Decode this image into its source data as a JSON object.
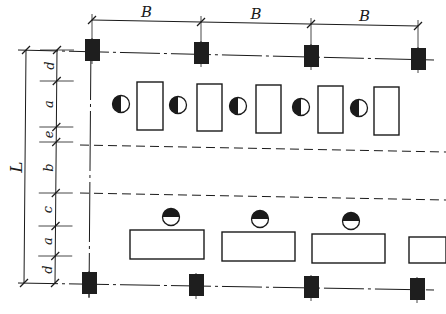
{
  "diagram": {
    "type": "workshop-layout-plan",
    "background": "#ffffff",
    "ink": "#1a1a1a",
    "column_color": "#1e1e1e",
    "top_dimension": {
      "label": "B",
      "spans": [
        {
          "label": "B",
          "x1": 92,
          "x2": 201
        },
        {
          "label": "B",
          "x1": 201,
          "x2": 311
        },
        {
          "label": "B",
          "x1": 311,
          "x2": 418
        }
      ]
    },
    "left_dimension": {
      "total_label": "L",
      "segments": [
        {
          "label": "d",
          "y1": 50,
          "y2": 81
        },
        {
          "label": "a",
          "y1": 81,
          "y2": 127
        },
        {
          "label": "e",
          "y1": 127,
          "y2": 142
        },
        {
          "label": "b",
          "y1": 142,
          "y2": 193
        },
        {
          "label": "c",
          "y1": 193,
          "y2": 226
        },
        {
          "label": "a",
          "y1": 226,
          "y2": 256
        },
        {
          "label": "d",
          "y1": 256,
          "y2": 283
        }
      ]
    },
    "columns_top": [
      {
        "x": 92,
        "y": 50
      },
      {
        "x": 201,
        "y": 53
      },
      {
        "x": 311,
        "y": 56
      },
      {
        "x": 418,
        "y": 59
      }
    ],
    "columns_bottom": [
      {
        "x": 89,
        "y": 283
      },
      {
        "x": 196,
        "y": 285
      },
      {
        "x": 311,
        "y": 287
      },
      {
        "x": 417,
        "y": 289
      }
    ],
    "machines_top": [
      {
        "x": 137,
        "y": 82,
        "w": 26,
        "h": 48
      },
      {
        "x": 197,
        "y": 84,
        "w": 25,
        "h": 47
      },
      {
        "x": 256,
        "y": 85,
        "w": 25,
        "h": 48
      },
      {
        "x": 318,
        "y": 86,
        "w": 25,
        "h": 47
      },
      {
        "x": 374,
        "y": 87,
        "w": 25,
        "h": 48
      }
    ],
    "operators_top": [
      {
        "x": 121,
        "y": 104
      },
      {
        "x": 178,
        "y": 105
      },
      {
        "x": 238,
        "y": 106
      },
      {
        "x": 301,
        "y": 107
      },
      {
        "x": 359,
        "y": 108
      }
    ],
    "machines_bottom": [
      {
        "x": 130,
        "y": 230,
        "w": 74,
        "h": 29
      },
      {
        "x": 222,
        "y": 232,
        "w": 73,
        "h": 29
      },
      {
        "x": 312,
        "y": 234,
        "w": 73,
        "h": 29
      },
      {
        "x": 409,
        "y": 237,
        "w": 37,
        "h": 26
      }
    ],
    "operators_bottom": [
      {
        "x": 171,
        "y": 217
      },
      {
        "x": 260,
        "y": 219
      },
      {
        "x": 351,
        "y": 221
      }
    ],
    "aisle_lines": [
      {
        "x1": 80,
        "y1": 145,
        "x2": 446,
        "y2": 152
      },
      {
        "x1": 80,
        "y1": 193,
        "x2": 446,
        "y2": 200
      }
    ]
  }
}
